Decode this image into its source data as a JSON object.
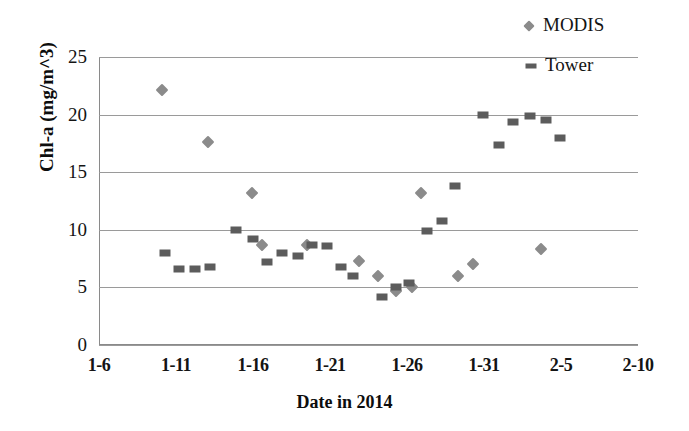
{
  "chart_data": {
    "type": "scatter",
    "title": "",
    "xlabel": "Date in 2014",
    "ylabel": "Chl-a (mg/m^3)",
    "ylim": [
      0,
      25
    ],
    "ytick_labels": [
      "0",
      "5",
      "10",
      "15",
      "20",
      "25"
    ],
    "ytick_values": [
      0,
      5,
      10,
      15,
      20,
      25
    ],
    "xlim_days": [
      6,
      41
    ],
    "xtick_labels": [
      "1-6",
      "1-11",
      "1-16",
      "1-21",
      "1-26",
      "1-31",
      "2-5",
      "2-10"
    ],
    "xtick_days": [
      6,
      11,
      16,
      21,
      26,
      31,
      36,
      41
    ],
    "grid": "horizontal",
    "legend_position": "top-right",
    "series": [
      {
        "name": "MODIS",
        "marker": "diamond",
        "color": "#8b8b8b",
        "points": [
          {
            "x": "1-10",
            "day": 10.1,
            "y": 22.1
          },
          {
            "x": "1-13",
            "day": 13.1,
            "y": 17.6
          },
          {
            "x": "1-15",
            "day": 15.9,
            "y": 13.2
          },
          {
            "x": "1-16",
            "day": 16.6,
            "y": 8.7
          },
          {
            "x": "1-19",
            "day": 19.5,
            "y": 8.7
          },
          {
            "x": "1-23",
            "day": 22.9,
            "y": 7.3
          },
          {
            "x": "1-24",
            "day": 24.1,
            "y": 6.0
          },
          {
            "x": "1-25",
            "day": 25.3,
            "y": 4.7
          },
          {
            "x": "1-26",
            "day": 26.3,
            "y": 5.0
          },
          {
            "x": "1-27",
            "day": 26.9,
            "y": 13.2
          },
          {
            "x": "1-29",
            "day": 29.3,
            "y": 6.0
          },
          {
            "x": "1-30",
            "day": 30.3,
            "y": 7.0
          },
          {
            "x": "2-4",
            "day": 34.7,
            "y": 8.3
          }
        ]
      },
      {
        "name": "Tower",
        "marker": "square",
        "color": "#5c5c5c",
        "points": [
          {
            "x": "1-10",
            "day": 10.3,
            "y": 8.0
          },
          {
            "x": "1-11",
            "day": 11.2,
            "y": 6.6
          },
          {
            "x": "1-12",
            "day": 12.2,
            "y": 6.6
          },
          {
            "x": "1-13",
            "day": 13.2,
            "y": 6.8
          },
          {
            "x": "1-15",
            "day": 14.9,
            "y": 10.0
          },
          {
            "x": "1-16",
            "day": 16.0,
            "y": 9.2
          },
          {
            "x": "1-17",
            "day": 16.9,
            "y": 7.2
          },
          {
            "x": "1-18",
            "day": 17.9,
            "y": 8.0
          },
          {
            "x": "1-19",
            "day": 18.9,
            "y": 7.7
          },
          {
            "x": "1-20",
            "day": 19.8,
            "y": 8.7
          },
          {
            "x": "1-21",
            "day": 20.8,
            "y": 8.6
          },
          {
            "x": "1-22",
            "day": 21.7,
            "y": 6.8
          },
          {
            "x": "1-23",
            "day": 22.5,
            "y": 6.0
          },
          {
            "x": "1-24",
            "day": 24.4,
            "y": 4.2
          },
          {
            "x": "1-25",
            "day": 25.3,
            "y": 5.0
          },
          {
            "x": "1-26",
            "day": 26.1,
            "y": 5.4
          },
          {
            "x": "1-27",
            "day": 27.3,
            "y": 9.9
          },
          {
            "x": "1-28",
            "day": 28.3,
            "y": 10.8
          },
          {
            "x": "1-29",
            "day": 29.1,
            "y": 13.8
          },
          {
            "x": "1-31",
            "day": 30.9,
            "y": 20.0
          },
          {
            "x": "2-1",
            "day": 32.0,
            "y": 17.4
          },
          {
            "x": "2-2",
            "day": 32.9,
            "y": 19.4
          },
          {
            "x": "2-3",
            "day": 34.0,
            "y": 19.9
          },
          {
            "x": "2-4",
            "day": 35.0,
            "y": 19.5
          },
          {
            "x": "2-5",
            "day": 35.9,
            "y": 18.0
          }
        ]
      }
    ]
  },
  "legend": {
    "modis_label": "MODIS",
    "tower_label": "Tower"
  }
}
